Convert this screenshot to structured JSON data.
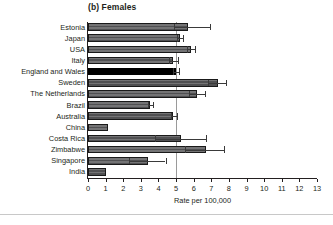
{
  "chart_data": {
    "type": "bar",
    "orientation": "horizontal",
    "title": "(b) Females",
    "xlabel": "Rate per 100,000",
    "ylabel": "",
    "xlim": [
      0,
      13
    ],
    "xticks": [
      0,
      1,
      2,
      3,
      4,
      5,
      6,
      7,
      8,
      9,
      10,
      11,
      12,
      13
    ],
    "xticklabels": [
      "0",
      "1",
      "2",
      "3",
      "4",
      "5",
      "6",
      "7",
      "8",
      "9",
      "10",
      "11",
      "12",
      "13"
    ],
    "grid": false,
    "legend": null,
    "reference_line": {
      "value": 5.0,
      "orientation": "vertical",
      "color": "#9a9a9a"
    },
    "highlight_category": "England and Wales",
    "colors": {
      "bar": "#59595b",
      "bar_highlight": "#000000",
      "bar_edge": "#1a1a1a",
      "error_bar": "#3a3a3a",
      "axis": "#231f20",
      "reference_line": "#9a9a9a"
    },
    "categories": [
      "Estonia",
      "Japan",
      "USA",
      "Italy",
      "England and Wales",
      "Sweden",
      "The Netherlands",
      "Brazil",
      "Australia",
      "China",
      "Costa Rica",
      "Zimbabwe",
      "Singapore",
      "India"
    ],
    "values": [
      5.65,
      5.2,
      5.85,
      4.85,
      5.0,
      7.4,
      6.2,
      3.5,
      4.85,
      1.15,
      5.3,
      6.7,
      3.4,
      1.05
    ],
    "error_low": [
      4.9,
      5.05,
      5.6,
      4.6,
      4.85,
      6.8,
      5.75,
      3.4,
      4.7,
      null,
      3.8,
      5.5,
      2.3,
      null
    ],
    "error_high": [
      6.9,
      5.4,
      6.05,
      5.1,
      5.15,
      7.85,
      6.65,
      3.7,
      5.05,
      null,
      6.7,
      7.7,
      4.4,
      null
    ],
    "series": [
      {
        "name": "Rate per 100,000 (females)",
        "values": [
          5.65,
          5.2,
          5.85,
          4.85,
          5.0,
          7.4,
          6.2,
          3.5,
          4.85,
          1.15,
          5.3,
          6.7,
          3.4,
          1.05
        ]
      }
    ]
  }
}
